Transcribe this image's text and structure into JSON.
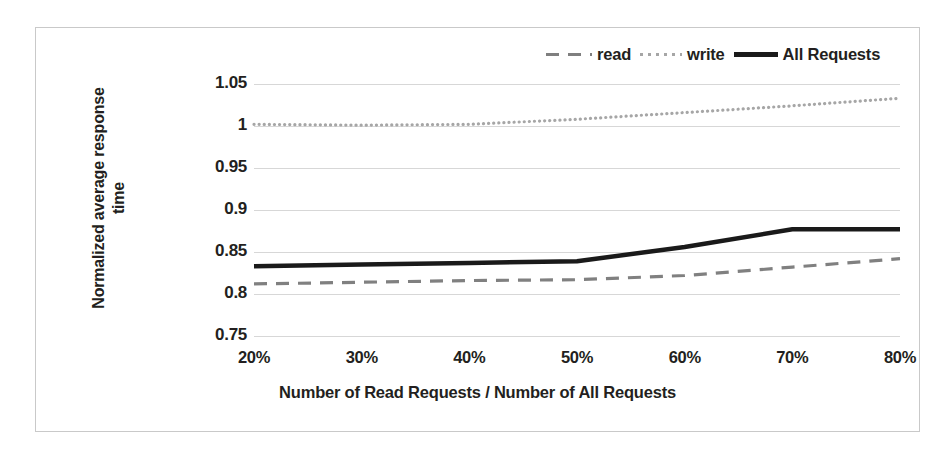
{
  "chart_data": {
    "type": "line",
    "title": "",
    "xlabel": "Number of Read Requests / Number of All Requests",
    "ylabel": "Normalized average response time",
    "categories": [
      "20%",
      "30%",
      "40%",
      "50%",
      "60%",
      "70%",
      "80%"
    ],
    "x": [
      20,
      30,
      40,
      50,
      60,
      70,
      80
    ],
    "xlim": [
      20,
      80
    ],
    "ylim": [
      0.75,
      1.05
    ],
    "yticks": [
      "0.75",
      "0.8",
      "0.85",
      "0.9",
      "0.95",
      "1",
      "1.05"
    ],
    "ytick_values": [
      0.75,
      0.8,
      0.85,
      0.9,
      0.95,
      1.0,
      1.05
    ],
    "grid": true,
    "legend_position": "top-right",
    "series": [
      {
        "name": "read",
        "style": "dashed",
        "color": "#808080",
        "values": [
          0.812,
          0.814,
          0.816,
          0.817,
          0.822,
          0.832,
          0.842
        ]
      },
      {
        "name": "write",
        "style": "dotted",
        "color": "#a6a6a6",
        "values": [
          1.002,
          1.001,
          1.002,
          1.008,
          1.016,
          1.024,
          1.033
        ]
      },
      {
        "name": "All Requests",
        "style": "solid",
        "color": "#1a1a1a",
        "values": [
          0.833,
          0.835,
          0.837,
          0.839,
          0.856,
          0.877,
          0.877
        ]
      }
    ]
  },
  "legend": {
    "items": [
      {
        "label": "read",
        "swatch": "dashed-line-swatch"
      },
      {
        "label": "write",
        "swatch": "dotted-line-swatch"
      },
      {
        "label": "All Requests",
        "swatch": "solid-line-swatch"
      }
    ]
  },
  "axes": {
    "y_title_line1": "Normalized average response",
    "y_title_line2": "time",
    "x_title": "Number of Read Requests / Number of All Requests"
  }
}
